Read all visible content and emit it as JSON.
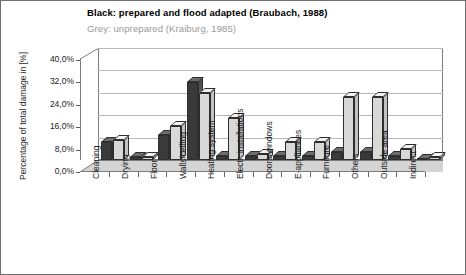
{
  "chart_data": {
    "type": "bar",
    "title": "Black:  prepared and flood adapted (Braubach, 1988)",
    "subtitle": "Grey: unprepared (Kraiburg, 1985)",
    "xlabel": "",
    "ylabel": "Percentage of total damage in [%]",
    "ylim": [
      0,
      40
    ],
    "ytick_labels": [
      "0,0%",
      "8,0%",
      "16,0%",
      "24,0%",
      "32,0%",
      "40,0%"
    ],
    "ytick_values": [
      0,
      8,
      16,
      24,
      32,
      40
    ],
    "grid": true,
    "legend_position": "title",
    "categories": [
      "Cleaning",
      "Drying",
      "Floor",
      "Walls/ceiling",
      "Heating system",
      "Electr. installations",
      "Doors/windows",
      "E-appliances",
      "Furniture",
      "Others",
      "Outside area",
      "Indirect"
    ],
    "series": [
      {
        "name": "Black: prepared and flood adapted (Braubach, 1988)",
        "color": "#3a3a3a",
        "values": [
          6.5,
          1.0,
          9.0,
          28.0,
          1.5,
          1.5,
          1.5,
          1.5,
          3.0,
          3.0,
          1.5,
          0.5
        ]
      },
      {
        "name": "Grey: unprepared (Kraiburg, 1985)",
        "color": "#d8d8d8",
        "values": [
          7.0,
          1.0,
          12.0,
          24.0,
          15.0,
          2.0,
          6.5,
          6.5,
          22.5,
          22.5,
          4.0,
          1.0
        ]
      }
    ]
  }
}
